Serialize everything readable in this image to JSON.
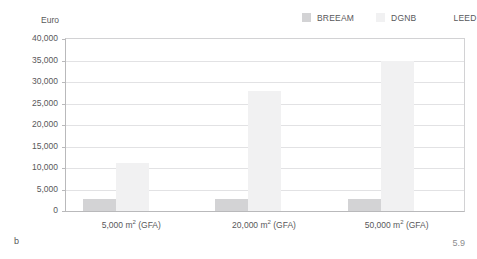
{
  "figure": {
    "panel_letter": "b",
    "figure_number": "5.9"
  },
  "chart_data": {
    "type": "bar",
    "title": "",
    "subtitle": "",
    "xlabel": "",
    "ylabel": "Euro",
    "ylim": [
      0,
      40000
    ],
    "ytick_values": [
      0,
      5000,
      10000,
      15000,
      20000,
      25000,
      30000,
      35000,
      40000
    ],
    "ytick_labels": [
      "0",
      "5,000",
      "10,000",
      "15,000",
      "20,000",
      "25,000",
      "30,000",
      "35,000",
      "40,000"
    ],
    "grid": true,
    "legend_position": "top-right",
    "categories": [
      "5,000 m² (GFA)",
      "20,000 m² (GFA)",
      "50,000 m² (GFA)"
    ],
    "category_label_parts": [
      {
        "area": "5,000 m",
        "sup": "2",
        "suffix": " (GFA)"
      },
      {
        "area": "20,000 m",
        "sup": "2",
        "suffix": " (GFA)"
      },
      {
        "area": "50,000 m",
        "sup": "2",
        "suffix": " (GFA)"
      }
    ],
    "series": [
      {
        "name": "BREEAM",
        "color": "#d3d3d5",
        "values": [
          2800,
          2800,
          2800
        ]
      },
      {
        "name": "DGNB",
        "color": "#f1f1f2",
        "values": [
          11100,
          27800,
          34800
        ]
      },
      {
        "name": "LEED",
        "color": "#fdfdfd",
        "values": [
          0,
          0,
          0
        ]
      }
    ]
  },
  "legend": {
    "items": [
      {
        "label": "BREEAM",
        "color": "#d3d3d5"
      },
      {
        "label": "DGNB",
        "color": "#f1f1f2"
      },
      {
        "label": "LEED",
        "color": "#ffffff"
      }
    ]
  },
  "colors": {
    "background": "#ffffff",
    "text": "#58585a",
    "gridline": "#e2e2e4",
    "axis": "#b9b9bb"
  }
}
